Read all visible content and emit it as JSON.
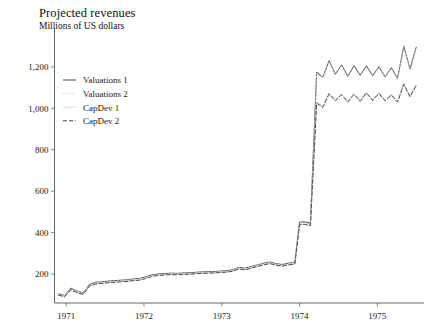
{
  "header": {
    "title": "Projected revenues",
    "subtitle": "Millions of US dollars"
  },
  "legend": {
    "position": "top-left-inside",
    "items": [
      {
        "label": "Valuations 1",
        "style": "solid",
        "color": "#3a3a3a"
      },
      {
        "label": "Valuations 2",
        "style": "dotted",
        "color": "#c9c9c9"
      },
      {
        "label": "CapDev 1",
        "style": "solid",
        "color": "#d6d6d6"
      },
      {
        "label": "CapDev 2",
        "style": "dashed",
        "color": "#3a3a3a"
      }
    ]
  },
  "axes": {
    "y_ticks": [
      "200",
      "400",
      "600",
      "800",
      "1,000",
      "1,200"
    ],
    "x_ticks": [
      "1971",
      "1972",
      "1973",
      "1974",
      "1975"
    ]
  },
  "chart_data": {
    "type": "line",
    "title": "Projected revenues",
    "subtitle": "Millions of US dollars",
    "xlabel": "",
    "ylabel": "Millions of US dollars",
    "xlim": [
      1970.85,
      1975.6
    ],
    "ylim": [
      60,
      1330
    ],
    "ytick_values": [
      200,
      400,
      600,
      800,
      1000,
      1200
    ],
    "ytick_labels": [
      "200",
      "400",
      "600",
      "800",
      "1,000",
      "1,200"
    ],
    "xtick_values": [
      1971,
      1972,
      1973,
      1974,
      1975
    ],
    "xtick_labels": [
      "1971",
      "1972",
      "1973",
      "1974",
      "1975"
    ],
    "grid": false,
    "legend_position": "upper left",
    "x": [
      1970.9,
      1970.98,
      1971.06,
      1971.14,
      1971.22,
      1971.3,
      1971.38,
      1971.46,
      1971.54,
      1971.62,
      1971.7,
      1971.78,
      1971.86,
      1971.94,
      1972.02,
      1972.1,
      1972.18,
      1972.26,
      1972.34,
      1972.42,
      1972.5,
      1972.58,
      1972.66,
      1972.74,
      1972.82,
      1972.9,
      1972.98,
      1973.06,
      1973.14,
      1973.22,
      1973.3,
      1973.38,
      1973.46,
      1973.54,
      1973.62,
      1973.7,
      1973.78,
      1973.86,
      1973.94,
      1974.0,
      1974.06,
      1974.14,
      1974.22,
      1974.3,
      1974.38,
      1974.46,
      1974.54,
      1974.62,
      1974.7,
      1974.78,
      1974.86,
      1974.94,
      1975.02,
      1975.1,
      1975.18,
      1975.26,
      1975.34,
      1975.42,
      1975.5
    ],
    "series": [
      {
        "name": "Valuations 1",
        "style": "solid",
        "color": "#3a3a3a",
        "values": [
          105,
          96,
          132,
          118,
          108,
          150,
          160,
          162,
          166,
          168,
          170,
          172,
          176,
          178,
          186,
          196,
          200,
          202,
          204,
          203,
          205,
          206,
          208,
          210,
          211,
          212,
          214,
          216,
          220,
          232,
          228,
          236,
          244,
          252,
          258,
          250,
          246,
          252,
          258,
          450,
          452,
          446,
          1175,
          1150,
          1230,
          1165,
          1210,
          1155,
          1205,
          1160,
          1205,
          1158,
          1200,
          1152,
          1196,
          1145,
          1300,
          1190,
          1295
        ]
      },
      {
        "name": "Valuations 2",
        "style": "dotted",
        "color": "#c9c9c9",
        "values": [
          104,
          95,
          130,
          117,
          107,
          148,
          158,
          160,
          164,
          166,
          168,
          170,
          174,
          176,
          184,
          194,
          198,
          200,
          202,
          201,
          203,
          204,
          206,
          208,
          209,
          210,
          212,
          214,
          218,
          230,
          226,
          234,
          242,
          250,
          256,
          248,
          244,
          250,
          256,
          446,
          448,
          442,
          1170,
          1146,
          1226,
          1160,
          1206,
          1150,
          1200,
          1156,
          1200,
          1154,
          1196,
          1148,
          1192,
          1140,
          1296,
          1186,
          1290
        ]
      },
      {
        "name": "CapDev 1",
        "style": "solid",
        "color": "#d6d6d6",
        "values": [
          100,
          92,
          126,
          112,
          103,
          144,
          154,
          157,
          160,
          162,
          164,
          166,
          170,
          172,
          180,
          190,
          195,
          197,
          199,
          198,
          200,
          201,
          203,
          205,
          206,
          207,
          209,
          211,
          215,
          226,
          222,
          230,
          238,
          246,
          252,
          244,
          240,
          246,
          250,
          440,
          442,
          436,
          1030,
          1010,
          1075,
          1040,
          1070,
          1035,
          1072,
          1038,
          1078,
          1042,
          1076,
          1040,
          1068,
          1035,
          1120,
          1060,
          1115
        ]
      },
      {
        "name": "CapDev 2",
        "style": "dashed",
        "color": "#3a3a3a",
        "values": [
          98,
          90,
          124,
          110,
          101,
          142,
          152,
          155,
          158,
          160,
          162,
          164,
          168,
          170,
          178,
          188,
          193,
          195,
          197,
          196,
          198,
          199,
          201,
          203,
          204,
          205,
          207,
          209,
          213,
          224,
          220,
          228,
          236,
          244,
          250,
          242,
          238,
          244,
          248,
          438,
          440,
          434,
          1025,
          1005,
          1070,
          1036,
          1066,
          1030,
          1068,
          1034,
          1074,
          1038,
          1072,
          1036,
          1064,
          1030,
          1116,
          1056,
          1110
        ]
      }
    ]
  }
}
